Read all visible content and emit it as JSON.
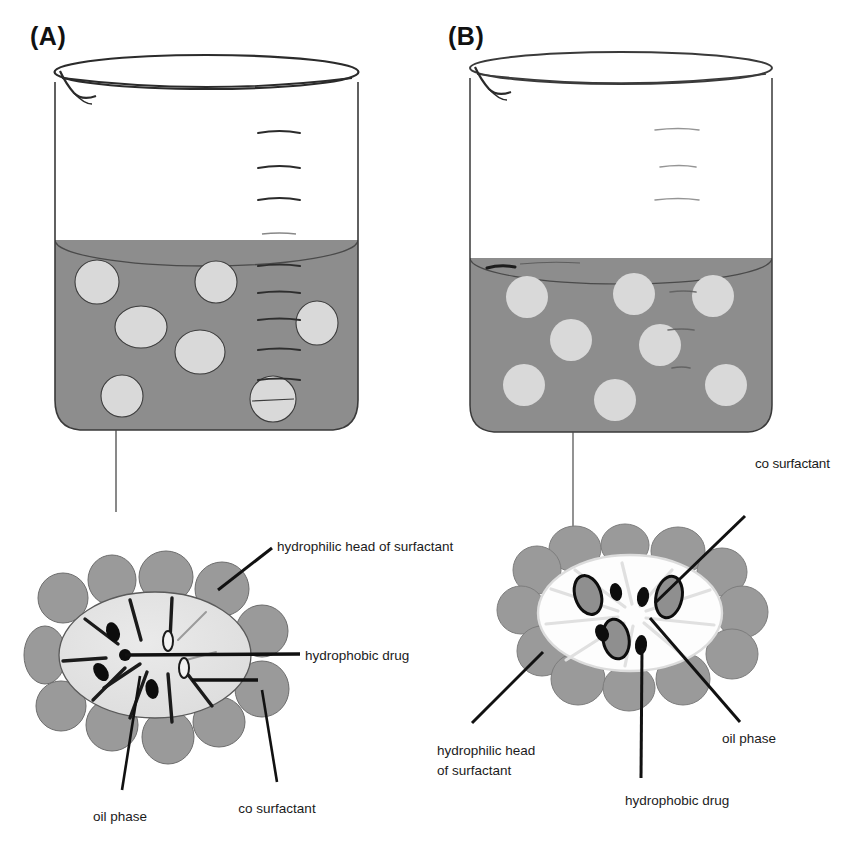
{
  "figure": {
    "type": "scientific-diagram",
    "background_color": "#ffffff",
    "ink_color": "#1a1a1a"
  },
  "colors": {
    "fluid_gray": "#8d8d8d",
    "fluid_gray_dark": "#7e7e7e",
    "droplet_light": "#d8d8d8",
    "surfactant_head": "#9a9a9a",
    "oil_core_left": "#e2e2e2",
    "oil_core_right": "#fdfdfd",
    "outline": "#2b2b2b",
    "glass_outline": "#3a3a3a",
    "drug_dark": "#0d0d0d",
    "tail_light": "#e8e8e8"
  },
  "panels": [
    {
      "id": "A",
      "label": "(A)",
      "beaker": {
        "name": "beaker-a",
        "graduation_marks": 7,
        "fill_level_label": "",
        "droplet_count": 7,
        "droplet_size": "large",
        "droplets": [
          {
            "cx": 97,
            "cy": 282,
            "rx": 22,
            "ry": 22
          },
          {
            "cx": 216,
            "cy": 282,
            "rx": 21,
            "ry": 21
          },
          {
            "cx": 141,
            "cy": 327,
            "rx": 26,
            "ry": 21
          },
          {
            "cx": 317,
            "cy": 323,
            "rx": 21,
            "ry": 22
          },
          {
            "cx": 200,
            "cy": 352,
            "rx": 25,
            "ry": 22
          },
          {
            "cx": 122,
            "cy": 396,
            "rx": 21,
            "ry": 21
          },
          {
            "cx": 273,
            "cy": 399,
            "rx": 23,
            "ry": 23
          }
        ]
      },
      "micelle": {
        "name": "micelle-a",
        "core_style": "filled-light-oil",
        "head_count": 14,
        "drug_count": 3,
        "has_tails": true
      },
      "callouts": [
        {
          "name": "callout-hydrophilic-head",
          "text": "hydrophilic head of surfactant",
          "x": 277,
          "y": 538,
          "align": "left"
        },
        {
          "name": "callout-hydrophobic-drug",
          "text": "hydrophobic drug",
          "x": 305,
          "y": 647,
          "align": "left"
        },
        {
          "name": "callout-oil-phase",
          "text": "oil phase",
          "x": 120,
          "y": 808,
          "align": "center"
        },
        {
          "name": "callout-co-surfactant",
          "text": "co surfactant",
          "x": 277,
          "y": 800,
          "align": "center"
        }
      ]
    },
    {
      "id": "B",
      "label": "(B)",
      "beaker": {
        "name": "beaker-b",
        "graduation_marks": 3,
        "fill_level_label": "",
        "droplet_count": 8,
        "droplet_size": "small",
        "droplets": [
          {
            "cx": 527,
            "cy": 297,
            "rx": 21,
            "ry": 21
          },
          {
            "cx": 634,
            "cy": 294,
            "rx": 21,
            "ry": 21
          },
          {
            "cx": 713,
            "cy": 296,
            "rx": 21,
            "ry": 21
          },
          {
            "cx": 571,
            "cy": 340,
            "rx": 21,
            "ry": 21
          },
          {
            "cx": 660,
            "cy": 345,
            "rx": 21,
            "ry": 21
          },
          {
            "cx": 524,
            "cy": 385,
            "rx": 21,
            "ry": 21
          },
          {
            "cx": 615,
            "cy": 400,
            "rx": 21,
            "ry": 21
          },
          {
            "cx": 726,
            "cy": 385,
            "rx": 21,
            "ry": 21
          }
        ]
      },
      "micelle": {
        "name": "micelle-b",
        "core_style": "open-transparent",
        "head_count": 15,
        "drug_count": 5,
        "ringed_drug_count": 3,
        "has_tails": true
      },
      "callouts": [
        {
          "name": "callout-cosurfactant",
          "text": "co surfactant",
          "x": 755,
          "y": 463,
          "align": "left"
        },
        {
          "name": "callout-hydrophilic-head-line1",
          "text": "hydrophilic head",
          "x": 437,
          "y": 751,
          "align": "left"
        },
        {
          "name": "callout-hydrophilic-head-line2",
          "text": "of surfactant",
          "x": 437,
          "y": 770,
          "align": "left"
        },
        {
          "name": "callout-hydrophobic-drug",
          "text": "hydrophobic drug",
          "x": 625,
          "y": 801,
          "align": "left"
        },
        {
          "name": "callout-oil-phase",
          "text": "oil phase",
          "x": 722,
          "y": 739,
          "align": "left"
        }
      ]
    }
  ]
}
